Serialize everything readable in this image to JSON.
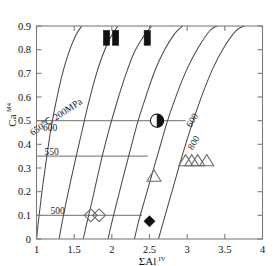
{
  "chart_data": {
    "type": "scatter",
    "title": "",
    "subtitle": "",
    "xlabel": "ΣAl",
    "xlabel_superscript": "IV",
    "ylabel": "Ca",
    "ylabel_superscript": "M4",
    "xlim": [
      1,
      4
    ],
    "ylim": [
      0,
      0.9
    ],
    "grid": false,
    "legend_position": "none",
    "xticks": [
      "1",
      "1.5",
      "2",
      "2.5",
      "3",
      "3.5",
      "4"
    ],
    "xtick_values": [
      1,
      1.5,
      2,
      2.5,
      3,
      3.5,
      4
    ],
    "yticks": [
      "0",
      "0.1",
      "0.2",
      "0.3",
      "0.4",
      "0.5",
      "0.6",
      "0.7",
      "0.8",
      "0.9"
    ],
    "ytick_values": [
      0,
      0.1,
      0.2,
      0.3,
      0.4,
      0.5,
      0.6,
      0.7,
      0.8,
      0.9
    ],
    "isotherm_curves": [
      {
        "name": "650C-200MPa",
        "label": "650℃ 200MPa",
        "label_x": 1.28,
        "label_y": 0.505,
        "label_rotation": -33,
        "points": [
          [
            1.0,
            0.0
          ],
          [
            1.02,
            0.06
          ],
          [
            1.05,
            0.14
          ],
          [
            1.08,
            0.22
          ],
          [
            1.12,
            0.31
          ],
          [
            1.16,
            0.4
          ],
          [
            1.2,
            0.48
          ],
          [
            1.26,
            0.58
          ],
          [
            1.33,
            0.68
          ],
          [
            1.42,
            0.78
          ],
          [
            1.52,
            0.86
          ],
          [
            1.6,
            0.9
          ]
        ]
      },
      {
        "name": "600-left",
        "label": "600",
        "label_x": 1.18,
        "label_y": 0.455,
        "label_rotation": 0,
        "points": [
          [
            1.3,
            0.0
          ],
          [
            1.34,
            0.07
          ],
          [
            1.39,
            0.15
          ],
          [
            1.45,
            0.24
          ],
          [
            1.52,
            0.34
          ],
          [
            1.6,
            0.45
          ],
          [
            1.68,
            0.56
          ],
          [
            1.77,
            0.67
          ],
          [
            1.87,
            0.77
          ],
          [
            1.98,
            0.85
          ],
          [
            2.08,
            0.9
          ]
        ]
      },
      {
        "name": "550",
        "label": "550",
        "label_x": 1.2,
        "label_y": 0.355,
        "label_rotation": 0,
        "points": [
          [
            1.62,
            0.0
          ],
          [
            1.67,
            0.07
          ],
          [
            1.73,
            0.15
          ],
          [
            1.8,
            0.25
          ],
          [
            1.88,
            0.36
          ],
          [
            1.97,
            0.47
          ],
          [
            2.07,
            0.58
          ],
          [
            2.18,
            0.69
          ],
          [
            2.3,
            0.79
          ],
          [
            2.43,
            0.86
          ],
          [
            2.53,
            0.9
          ]
        ]
      },
      {
        "name": "500",
        "label": "500",
        "label_x": 1.28,
        "label_y": 0.105,
        "label_rotation": 0,
        "points": [
          [
            1.95,
            0.0
          ],
          [
            2.0,
            0.07
          ],
          [
            2.07,
            0.16
          ],
          [
            2.15,
            0.26
          ],
          [
            2.24,
            0.37
          ],
          [
            2.34,
            0.49
          ],
          [
            2.45,
            0.6
          ],
          [
            2.57,
            0.71
          ],
          [
            2.7,
            0.8
          ],
          [
            2.84,
            0.87
          ],
          [
            2.94,
            0.9
          ]
        ]
      },
      {
        "name": "600-right",
        "label": "600",
        "label_x": 3.1,
        "label_y": 0.495,
        "label_rotation": -58,
        "points": [
          [
            2.3,
            0.0
          ],
          [
            2.36,
            0.08
          ],
          [
            2.44,
            0.17
          ],
          [
            2.53,
            0.27
          ],
          [
            2.63,
            0.38
          ],
          [
            2.74,
            0.5
          ],
          [
            2.86,
            0.61
          ],
          [
            3.0,
            0.72
          ],
          [
            3.15,
            0.81
          ],
          [
            3.3,
            0.88
          ],
          [
            3.4,
            0.9
          ]
        ]
      },
      {
        "name": "800",
        "label": "800",
        "label_x": 3.12,
        "label_y": 0.4,
        "label_rotation": -58,
        "points": [
          [
            2.62,
            0.0
          ],
          [
            2.69,
            0.08
          ],
          [
            2.77,
            0.17
          ],
          [
            2.86,
            0.27
          ],
          [
            2.96,
            0.38
          ],
          [
            3.08,
            0.5
          ],
          [
            3.2,
            0.61
          ],
          [
            3.34,
            0.72
          ],
          [
            3.49,
            0.81
          ],
          [
            3.65,
            0.88
          ],
          [
            3.76,
            0.9
          ]
        ]
      }
    ],
    "reference_lines": [
      {
        "name": "ref-line-050",
        "y": 0.5,
        "x_start": 1.0,
        "x_end": 2.98
      },
      {
        "name": "ref-line-035",
        "y": 0.35,
        "x_start": 1.0,
        "x_end": 2.48
      },
      {
        "name": "ref-line-010",
        "y": 0.1,
        "x_start": 1.0,
        "x_end": 2.4
      }
    ],
    "data_series": [
      {
        "name": "filled-bars-top",
        "marker": "filled-rectangle",
        "color": "#111111",
        "points": [
          [
            1.93,
            0.85
          ],
          [
            2.05,
            0.85
          ],
          [
            2.47,
            0.85
          ]
        ]
      },
      {
        "name": "half-filled-circle",
        "marker": "half-filled-circle",
        "color": "#111111",
        "points": [
          [
            2.6,
            0.5
          ]
        ]
      },
      {
        "name": "open-diamonds",
        "marker": "open-diamond",
        "color": "#6a6a6a",
        "points": [
          [
            1.72,
            0.1
          ],
          [
            1.83,
            0.1
          ]
        ]
      },
      {
        "name": "filled-diamond",
        "marker": "filled-diamond",
        "color": "#111111",
        "points": [
          [
            2.5,
            0.075
          ]
        ]
      },
      {
        "name": "open-triangle-single",
        "marker": "open-triangle",
        "color": "#6a6a6a",
        "points": [
          [
            2.56,
            0.265
          ]
        ]
      },
      {
        "name": "open-triangle-cluster",
        "marker": "open-triangle",
        "color": "#6a6a6a",
        "points": [
          [
            2.98,
            0.33
          ],
          [
            3.06,
            0.33
          ],
          [
            3.14,
            0.33
          ],
          [
            3.26,
            0.33
          ]
        ]
      }
    ]
  }
}
